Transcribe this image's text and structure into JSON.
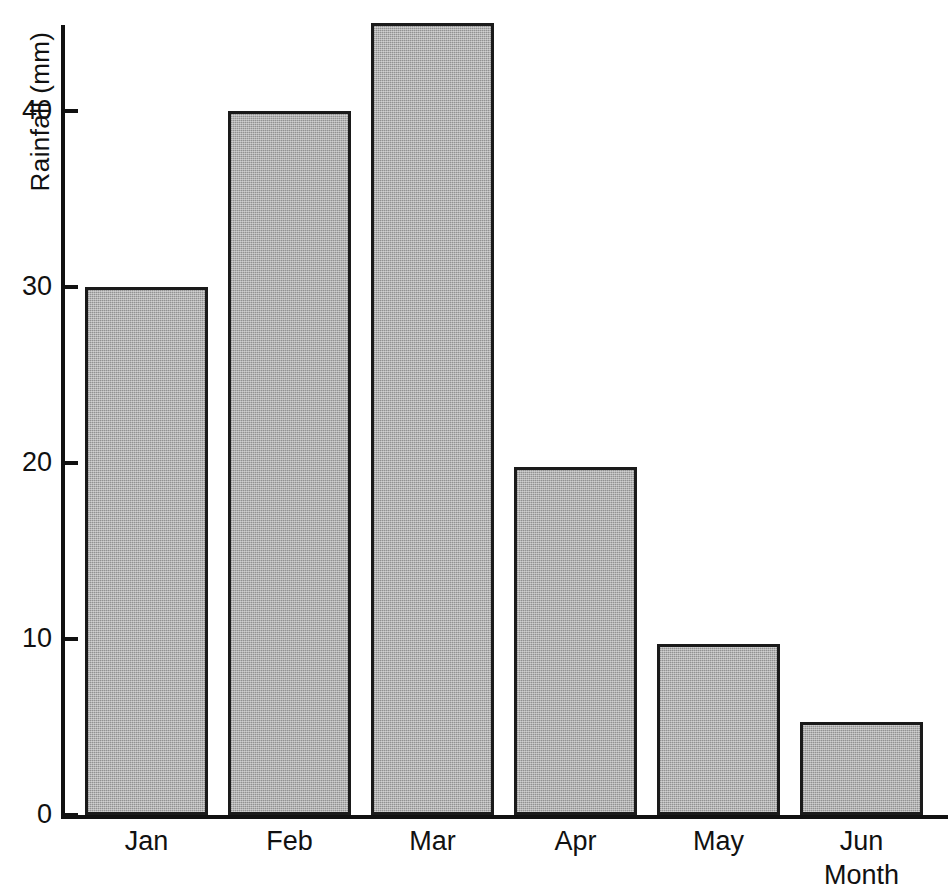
{
  "chart_data": {
    "type": "bar",
    "title": "",
    "categories": [
      "Jan",
      "Feb",
      "Mar",
      "Apr",
      "May",
      "Jun"
    ],
    "values": [
      30,
      40,
      45,
      19.8,
      9.7,
      5.3
    ],
    "xlabel": "Month",
    "ylabel": "Rainfall (mm)",
    "ylim": [
      0,
      45
    ],
    "yticks": [
      0,
      10,
      20,
      30,
      40
    ],
    "ytick_labels": [
      "0",
      "10",
      "20",
      "30",
      "40"
    ],
    "grid": false,
    "legend": null,
    "bar_fill_color": "#a9a9a9",
    "bar_edge_color": "#1a1a1a",
    "axis_color": "#111111",
    "background_color": "#ffffff"
  },
  "axes": {
    "y_title": "Rainfall (mm)",
    "x_title": "Month",
    "y_tick_labels": [
      "40",
      "30",
      "20",
      "10",
      "0"
    ],
    "x_tick_labels": [
      "Jan",
      "Feb",
      "Mar",
      "Apr",
      "May",
      "Jun"
    ]
  }
}
